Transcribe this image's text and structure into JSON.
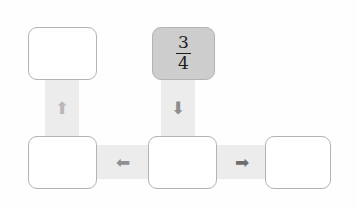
{
  "diagram": {
    "background_color": "#fefefe",
    "node_border_color": "#b3b3b3",
    "node_fill_empty": "#ffffff",
    "node_fill_highlight": "#cdcdcd",
    "connector_color": "#ececec",
    "nodes": [
      {
        "id": "node-top-left",
        "label": "",
        "state": "empty",
        "x": 28,
        "y": 27,
        "w": 69,
        "h": 53
      },
      {
        "id": "node-top-center",
        "label": "3/4",
        "numerator": "3",
        "denominator": "4",
        "state": "highlighted",
        "x": 152,
        "y": 27,
        "w": 63,
        "h": 53
      },
      {
        "id": "node-bottom-left",
        "label": "",
        "state": "empty",
        "x": 28,
        "y": 136,
        "w": 69,
        "h": 53
      },
      {
        "id": "node-bottom-center",
        "label": "",
        "state": "empty",
        "x": 148,
        "y": 136,
        "w": 69,
        "h": 53
      },
      {
        "id": "node-bottom-right",
        "label": "",
        "state": "empty",
        "x": 265,
        "y": 136,
        "w": 66,
        "h": 53
      }
    ],
    "connectors": [
      {
        "id": "connector-up-left",
        "orientation": "vertical",
        "direction": "up",
        "arrow_glyph": "⬆",
        "arrow_color": "#b8b8b8",
        "x": 45,
        "y": 74,
        "w": 34,
        "h": 68
      },
      {
        "id": "connector-down-center",
        "orientation": "vertical",
        "direction": "down",
        "arrow_glyph": "⬇",
        "arrow_color": "#8d8d8d",
        "x": 161,
        "y": 74,
        "w": 34,
        "h": 68
      },
      {
        "id": "connector-left",
        "orientation": "horizontal",
        "direction": "left",
        "arrow_glyph": "⬅",
        "arrow_color": "#909090",
        "x": 92,
        "y": 145,
        "w": 62,
        "h": 34
      },
      {
        "id": "connector-right",
        "orientation": "horizontal",
        "direction": "right",
        "arrow_glyph": "➡",
        "arrow_color": "#6e6e6e",
        "x": 212,
        "y": 145,
        "w": 60,
        "h": 34
      }
    ]
  }
}
